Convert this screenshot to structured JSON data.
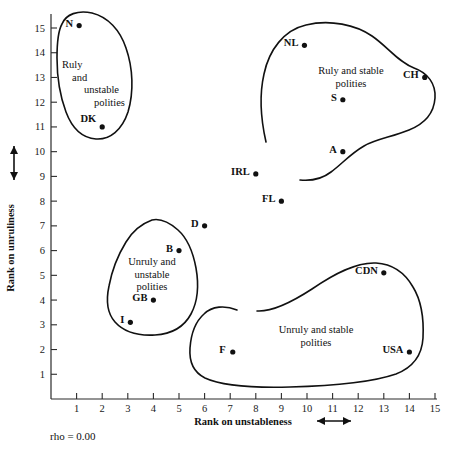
{
  "chart_data": {
    "type": "scatter",
    "title": "",
    "xlabel": "Rank on unstableness",
    "ylabel": "Rank on unruliness",
    "xlim": [
      0,
      15.6
    ],
    "ylim": [
      0,
      15.6
    ],
    "xticks": [
      1,
      2,
      3,
      4,
      5,
      6,
      7,
      8,
      9,
      10,
      11,
      12,
      13,
      14,
      15
    ],
    "yticks": [
      1,
      2,
      3,
      4,
      5,
      6,
      7,
      8,
      9,
      10,
      11,
      12,
      13,
      14,
      15
    ],
    "grid": false,
    "legend": "none",
    "annotations": [
      {
        "name": "rho-annotation",
        "text": "rho  =  0.00"
      }
    ],
    "points": [
      {
        "label": "N",
        "x": 1.1,
        "y": 15.1
      },
      {
        "label": "DK",
        "x": 2.0,
        "y": 11.0
      },
      {
        "label": "NL",
        "x": 9.9,
        "y": 14.3
      },
      {
        "label": "CH",
        "x": 14.6,
        "y": 13.0
      },
      {
        "label": "S",
        "x": 11.4,
        "y": 12.1
      },
      {
        "label": "A",
        "x": 11.4,
        "y": 10.0
      },
      {
        "label": "IRL",
        "x": 8.0,
        "y": 9.1
      },
      {
        "label": "FL",
        "x": 9.0,
        "y": 8.0
      },
      {
        "label": "D",
        "x": 6.0,
        "y": 7.0
      },
      {
        "label": "B",
        "x": 5.0,
        "y": 6.0
      },
      {
        "label": "GB",
        "x": 4.0,
        "y": 4.0
      },
      {
        "label": "I",
        "x": 3.1,
        "y": 3.1
      },
      {
        "label": "CDN",
        "x": 13.0,
        "y": 5.1
      },
      {
        "label": "USA",
        "x": 14.0,
        "y": 1.9
      },
      {
        "label": "F",
        "x": 7.1,
        "y": 1.9
      }
    ],
    "clusters": [
      {
        "name": "ruly-unstable",
        "lines": [
          "Ruly",
          "and",
          "unstable",
          "polities"
        ],
        "members": [
          "N",
          "DK"
        ]
      },
      {
        "name": "ruly-stable",
        "lines": [
          "Ruly and stable",
          "polities"
        ],
        "members": [
          "NL",
          "CH",
          "S",
          "A"
        ]
      },
      {
        "name": "unruly-unstable",
        "lines": [
          "Unruly and",
          "unstable",
          "polities"
        ],
        "members": [
          "B",
          "GB",
          "I"
        ]
      },
      {
        "name": "unruly-stable",
        "lines": [
          "Unruly and stable",
          "polities"
        ],
        "members": [
          "CDN",
          "USA",
          "F"
        ]
      }
    ]
  },
  "axis": {
    "x_title": "Rank on unstableness",
    "y_title": "Rank on unruliness",
    "x_tick_labels": [
      "1",
      "2",
      "3",
      "4",
      "5",
      "6",
      "7",
      "8",
      "9",
      "10",
      "11",
      "12",
      "13",
      "14",
      "15"
    ],
    "y_tick_labels": [
      "1",
      "2",
      "3",
      "4",
      "5",
      "6",
      "7",
      "8",
      "9",
      "10",
      "11",
      "12",
      "13",
      "14",
      "15"
    ]
  },
  "stats": {
    "rho_text": "rho  =  0.00"
  },
  "colors": {
    "ink": "#111111",
    "background": "#ffffff"
  }
}
